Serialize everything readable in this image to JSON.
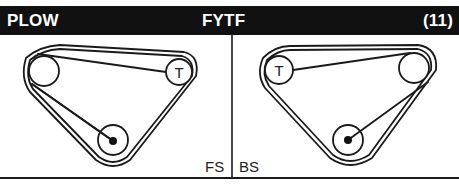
{
  "header": {
    "left": "PLOW",
    "center": "FYTF",
    "right": "(11)"
  },
  "panels": [
    {
      "label": "FS",
      "pulleys": [
        {
          "name": "large-pulley",
          "cx": 44,
          "cy": 71,
          "r": 15,
          "label": ""
        },
        {
          "name": "tensioner-pulley",
          "cx": 179,
          "cy": 72,
          "r": 13,
          "label": "T"
        },
        {
          "name": "crank-pulley",
          "cx": 113,
          "cy": 140,
          "r": 15,
          "label": ""
        }
      ]
    },
    {
      "label": "BS",
      "pulleys": [
        {
          "name": "tensioner-pulley",
          "cx": 279,
          "cy": 70,
          "r": 14,
          "label": "T"
        },
        {
          "name": "large-pulley",
          "cx": 414,
          "cy": 68,
          "r": 15,
          "label": ""
        },
        {
          "name": "crank-pulley",
          "cx": 348,
          "cy": 140,
          "r": 15,
          "label": ""
        }
      ]
    }
  ],
  "colors": {
    "header_bg": "#111111",
    "header_text": "#ffffff",
    "line": "#1a1a1a"
  }
}
